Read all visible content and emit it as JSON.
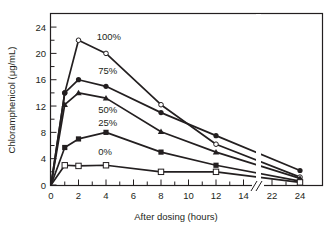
{
  "chart_data": {
    "type": "line",
    "title": "",
    "xlabel": "After dosing (hours)",
    "ylabel": "Chloramphenicol (μg/mL)",
    "x_ticks": [
      0,
      2,
      4,
      6,
      8,
      10,
      12,
      14,
      22,
      24
    ],
    "y_ticks": [
      0,
      4,
      8,
      12,
      16,
      20,
      24
    ],
    "xlim": [
      0,
      24
    ],
    "ylim": [
      0,
      26
    ],
    "axis_break": {
      "between": [
        14,
        22
      ],
      "symbol": "//"
    },
    "grid": false,
    "legend": "inline labels",
    "x": [
      0,
      1,
      2,
      4,
      8,
      12,
      24
    ],
    "series": [
      {
        "name": "100%",
        "marker": "open-circle",
        "values": [
          0,
          14,
          22,
          20,
          12.2,
          6.2,
          1.2
        ],
        "label_pos": {
          "x": 4.2,
          "y": 22
        }
      },
      {
        "name": "75%",
        "marker": "filled-circle",
        "values": [
          0,
          14,
          16,
          15,
          11,
          7.5,
          2.2
        ],
        "label_pos": {
          "x": 4.3,
          "y": 16.8
        }
      },
      {
        "name": "50%",
        "marker": "filled-triangle",
        "values": [
          0,
          12.2,
          14,
          13.2,
          8.1,
          5,
          1
        ],
        "label_pos": {
          "x": 4.3,
          "y": 11
        }
      },
      {
        "name": "25%",
        "marker": "filled-square",
        "values": [
          0,
          5.7,
          7,
          8,
          5,
          3,
          0.6
        ],
        "label_pos": {
          "x": 4.3,
          "y": 8.9
        }
      },
      {
        "name": "0%",
        "marker": "open-square",
        "values": [
          0,
          3,
          2.9,
          3,
          2,
          2,
          0.4
        ],
        "label_pos": {
          "x": 4.3,
          "y": 4.5
        }
      }
    ]
  },
  "colors": {
    "line": "#231f20",
    "background": "#ffffff"
  }
}
